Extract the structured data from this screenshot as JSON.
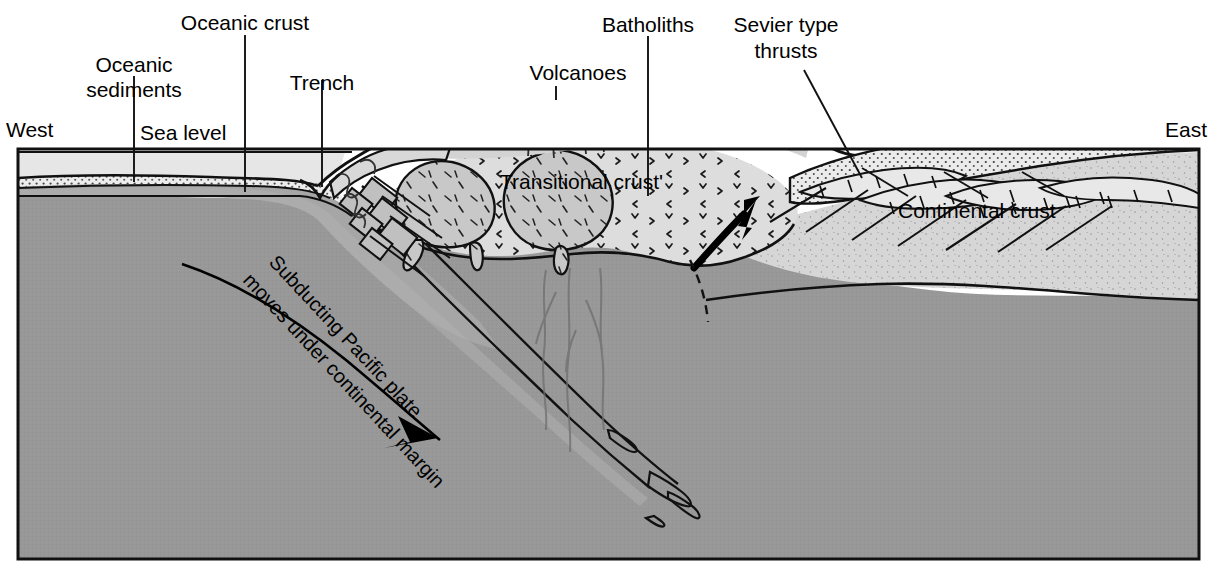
{
  "figure": {
    "orientation": {
      "west_label": "West",
      "east_label": "East"
    },
    "labels": {
      "oceanic_sediments": "Oceanic\nsediments",
      "oceanic_sediments_line1": "Oceanic",
      "oceanic_sediments_line2": "sediments",
      "oceanic_crust": "Oceanic crust",
      "sea_level": "Sea level",
      "trench": "Trench",
      "volcanoes": "Volcanoes",
      "batholiths": "Batholiths",
      "sevier_thrusts_line1": "Sevier type",
      "sevier_thrusts_line2": "thrusts",
      "transitional_crust": "Transitional crust'",
      "continental_crust": "Continental crust",
      "subducting_line1": "Subducting Pacific plate",
      "subducting_line2": "moves under continental margin"
    },
    "colors": {
      "background": "#ffffff",
      "ink": "#000000",
      "seawater": "#e6e6e6",
      "sediment": "#f7f7f7",
      "oceanic_crust": "#a8a8a8",
      "mantle": "#989898",
      "lithosphere_slab": "#a3a3a3",
      "transitional_crust": "#dcdcdc",
      "batholith": "#c6c6c6",
      "continental_crust": "#d2d2d2",
      "sedimentary_cover": "#e4e4e4",
      "volcanic_pile": "#cfcfcf"
    },
    "frame": {
      "x": 17,
      "y": 148,
      "width": 1183,
      "height": 412
    }
  }
}
